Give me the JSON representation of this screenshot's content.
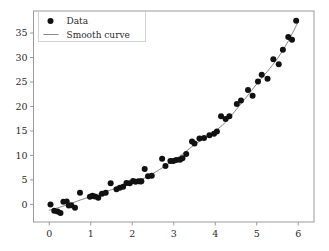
{
  "chart_data": {
    "type": "scatter",
    "title": "",
    "xlabel": "",
    "ylabel": "",
    "xlim": [
      -0.38,
      6.38
    ],
    "ylim": [
      -3.6,
      39.5
    ],
    "grid": false,
    "legend_position": "upper left",
    "xticks": [
      0,
      1,
      2,
      3,
      4,
      5,
      6
    ],
    "xticklabels": [
      "0",
      "1",
      "2",
      "3",
      "4",
      "5",
      "6"
    ],
    "yticks": [
      0,
      5,
      10,
      15,
      20,
      25,
      30,
      35
    ],
    "yticklabels": [
      "0",
      "5",
      "10",
      "15",
      "20",
      "25",
      "30",
      "35"
    ],
    "series": [
      {
        "name": "Data",
        "type": "scatter",
        "marker": "circle",
        "color": "#111111",
        "points": [
          [
            0.03,
            0.0
          ],
          [
            0.12,
            -1.3
          ],
          [
            0.2,
            -1.45
          ],
          [
            0.27,
            -1.75
          ],
          [
            0.34,
            0.55
          ],
          [
            0.42,
            0.6
          ],
          [
            0.47,
            -0.25
          ],
          [
            0.53,
            -0.2
          ],
          [
            0.62,
            -0.7
          ],
          [
            0.74,
            2.35
          ],
          [
            0.98,
            1.55
          ],
          [
            1.04,
            1.75
          ],
          [
            1.1,
            1.6
          ],
          [
            1.18,
            1.35
          ],
          [
            1.27,
            2.15
          ],
          [
            1.36,
            2.4
          ],
          [
            1.48,
            4.3
          ],
          [
            1.62,
            3.1
          ],
          [
            1.7,
            3.4
          ],
          [
            1.78,
            3.6
          ],
          [
            1.86,
            4.35
          ],
          [
            1.94,
            4.3
          ],
          [
            2.02,
            4.75
          ],
          [
            2.08,
            4.6
          ],
          [
            2.15,
            4.7
          ],
          [
            2.2,
            4.65
          ],
          [
            2.22,
            4.7
          ],
          [
            2.3,
            7.25
          ],
          [
            2.38,
            5.75
          ],
          [
            2.47,
            5.85
          ],
          [
            2.72,
            9.3
          ],
          [
            2.8,
            7.85
          ],
          [
            2.92,
            8.85
          ],
          [
            2.99,
            8.85
          ],
          [
            3.06,
            9.05
          ],
          [
            3.15,
            9.1
          ],
          [
            3.21,
            9.4
          ],
          [
            3.3,
            10.3
          ],
          [
            3.44,
            12.85
          ],
          [
            3.5,
            12.45
          ],
          [
            3.62,
            13.45
          ],
          [
            3.73,
            13.55
          ],
          [
            3.86,
            14.1
          ],
          [
            3.97,
            14.45
          ],
          [
            4.04,
            14.9
          ],
          [
            4.14,
            18.0
          ],
          [
            4.25,
            17.45
          ],
          [
            4.34,
            18.0
          ],
          [
            4.52,
            20.5
          ],
          [
            4.62,
            21.2
          ],
          [
            4.79,
            23.35
          ],
          [
            4.9,
            22.2
          ],
          [
            5.03,
            25.1
          ],
          [
            5.12,
            26.5
          ],
          [
            5.26,
            25.65
          ],
          [
            5.4,
            29.65
          ],
          [
            5.53,
            28.6
          ],
          [
            5.63,
            31.6
          ],
          [
            5.76,
            34.2
          ],
          [
            5.85,
            33.65
          ],
          [
            5.95,
            37.5
          ]
        ]
      },
      {
        "name": "Smooth curve",
        "type": "line",
        "color": "#7a7a7a",
        "x": [
          0.0,
          0.25,
          0.5,
          0.75,
          1.0,
          1.25,
          1.5,
          1.75,
          2.0,
          2.25,
          2.5,
          2.75,
          3.0,
          3.25,
          3.5,
          3.75,
          4.0,
          4.25,
          4.5,
          4.75,
          5.0,
          5.25,
          5.5,
          5.75,
          6.0
        ],
        "y": [
          -1.2,
          -0.6,
          0.1,
          0.9,
          1.6,
          2.3,
          3.0,
          3.6,
          4.3,
          5.2,
          6.3,
          7.6,
          9.0,
          10.5,
          12.2,
          13.6,
          15.0,
          16.8,
          19.3,
          21.9,
          24.6,
          27.1,
          29.8,
          33.2,
          37.3
        ]
      }
    ],
    "legend": [
      {
        "label": "Data",
        "marker": "circle",
        "color": "#111111"
      },
      {
        "label": "Smooth curve",
        "marker": "line",
        "color": "#7a7a7a"
      }
    ]
  },
  "axes": {
    "spine_color": "#9a9a9a",
    "background": "#ffffff"
  }
}
